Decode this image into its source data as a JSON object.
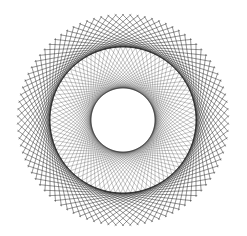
{
  "figure": {
    "width": 247,
    "height": 236,
    "background": "#ffffff",
    "stroke_color": "#1a1a1a",
    "center": [
      123,
      120
    ],
    "layers": [
      {
        "name": "outer-chords",
        "radius": 106,
        "envelope_radius": 73,
        "count": 90,
        "opacity": 0.55,
        "width": 0.6
      },
      {
        "name": "outer-chords-reverse",
        "radius": 106,
        "envelope_radius": 73,
        "count": 90,
        "opacity": 0.35,
        "width": 0.5,
        "phase": 2
      },
      {
        "name": "inner-chords",
        "radius": 74,
        "envelope_radius": 32,
        "count": 90,
        "opacity": 0.5,
        "width": 0.5
      }
    ]
  }
}
